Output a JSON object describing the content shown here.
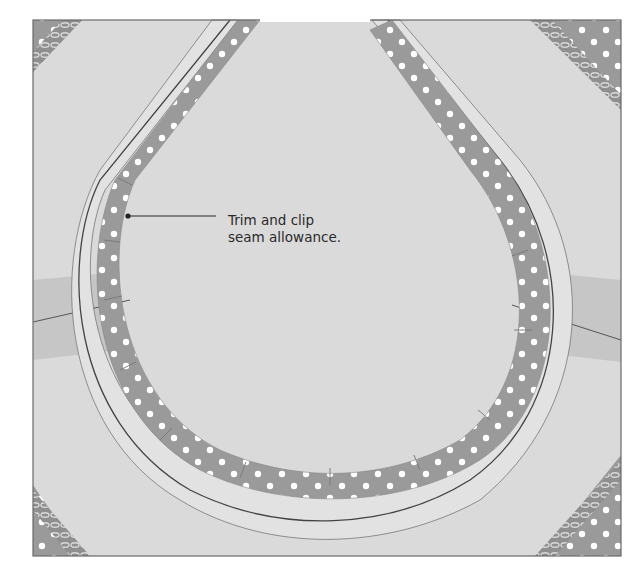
{
  "figure": {
    "annotations": [
      {
        "id": "trim-clip",
        "lines": [
          "Trim and clip",
          "seam allowance."
        ],
        "pointer_target": "seam allowance at left of neckline"
      }
    ],
    "colors": {
      "fabric": "#dadada",
      "fabric_light": "#e4e4e4",
      "seam_allowance": "#9a9a9a",
      "polka_dot": "#ffffff",
      "stitch_line": "#444444",
      "outline": "#6a6a6a",
      "shoulder_band": "#c9c9c9",
      "background": "#ffffff",
      "text": "#2a2a2a"
    },
    "elements": {
      "square_panel": {
        "x": 33,
        "y": 20,
        "width": 588,
        "height": 536
      },
      "corner_overlocks": [
        "top-left",
        "top-right",
        "bottom-left",
        "bottom-right"
      ],
      "shoulder_seams": [
        "left",
        "right"
      ]
    }
  }
}
